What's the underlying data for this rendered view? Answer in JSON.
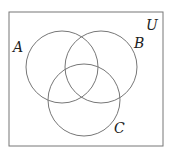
{
  "diagram": {
    "type": "venn",
    "universe": {
      "label": "U",
      "x": 9,
      "y": 12,
      "width": 154,
      "height": 134
    },
    "sets": [
      {
        "label": "A",
        "cx": 62,
        "cy": 67,
        "r": 36,
        "label_x": 15,
        "label_y": 50
      },
      {
        "label": "B",
        "cx": 101,
        "cy": 67,
        "r": 36,
        "label_x": 137,
        "label_y": 47
      },
      {
        "label": "C",
        "cx": 84,
        "cy": 100,
        "r": 36,
        "label_x": 115,
        "label_y": 132
      }
    ],
    "universe_label_pos": {
      "x": 148,
      "y": 30
    },
    "stroke_color": "#777777"
  }
}
